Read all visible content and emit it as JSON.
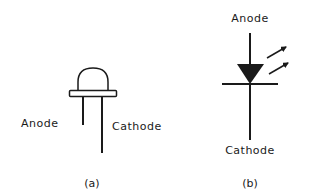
{
  "figure_a": {
    "anode_label": "Anode",
    "cathode_label": "Cathode",
    "caption": "(a)"
  },
  "figure_b": {
    "anode_label": "Anode",
    "cathode_label": "Cathode",
    "caption": "(b)"
  },
  "colors": {
    "ink": "#1a1a1a",
    "background": "#ffffff"
  }
}
